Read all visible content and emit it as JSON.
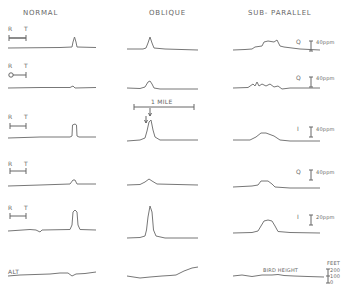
{
  "columns": {
    "normal": "NORMAL",
    "oblique": "OBLIQUE",
    "subparallel": "SUB- PARALLEL"
  },
  "rt_labels": {
    "r": "R",
    "t": "T"
  },
  "scale": {
    "distance": "1 MILE"
  },
  "rows": [
    {
      "sensor": "Q",
      "scale": "40ppm"
    },
    {
      "sensor": "Q",
      "scale": "40ppm"
    },
    {
      "sensor": "I",
      "scale": "40ppm"
    },
    {
      "sensor": "Q",
      "scale": "40ppm"
    },
    {
      "sensor": "I",
      "scale": "20ppm"
    }
  ],
  "altitude": {
    "label": "ALT",
    "bird_height": "BIRD HEIGHT",
    "unit": "FEET",
    "ticks": [
      "200",
      "100",
      "0"
    ]
  }
}
